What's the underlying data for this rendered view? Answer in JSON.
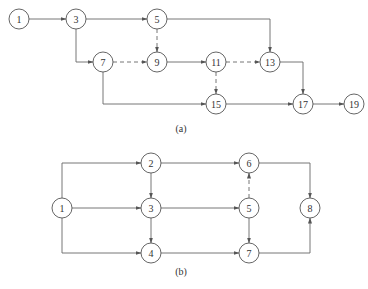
{
  "diagrams": [
    {
      "caption": "(a)",
      "caption_pos": [
        181,
        132
      ],
      "nodes": [
        {
          "id": "1",
          "x": 19,
          "y": 19
        },
        {
          "id": "3",
          "x": 76,
          "y": 19
        },
        {
          "id": "5",
          "x": 157,
          "y": 19
        },
        {
          "id": "7",
          "x": 103,
          "y": 62
        },
        {
          "id": "9",
          "x": 157,
          "y": 62
        },
        {
          "id": "11",
          "x": 216,
          "y": 62
        },
        {
          "id": "13",
          "x": 270,
          "y": 62
        },
        {
          "id": "15",
          "x": 216,
          "y": 104
        },
        {
          "id": "17",
          "x": 303,
          "y": 104
        },
        {
          "id": "19",
          "x": 354,
          "y": 104
        }
      ],
      "edges": [
        {
          "from": "1",
          "to": "3",
          "path": [
            [
              29,
              19
            ],
            [
              66,
              19
            ]
          ],
          "dashed": false
        },
        {
          "from": "3",
          "to": "5",
          "path": [
            [
              86,
              19
            ],
            [
              147,
              19
            ]
          ],
          "dashed": false
        },
        {
          "from": "3",
          "to": "7",
          "path": [
            [
              76,
              29
            ],
            [
              76,
              62
            ],
            [
              93,
              62
            ]
          ],
          "dashed": false
        },
        {
          "from": "5",
          "to": "9",
          "path": [
            [
              157,
              29
            ],
            [
              157,
              52
            ]
          ],
          "dashed": true
        },
        {
          "from": "5",
          "to": "13",
          "path": [
            [
              167,
              19
            ],
            [
              270,
              19
            ],
            [
              270,
              52
            ]
          ],
          "dashed": false
        },
        {
          "from": "7",
          "to": "9",
          "path": [
            [
              113,
              62
            ],
            [
              147,
              62
            ]
          ],
          "dashed": true
        },
        {
          "from": "7",
          "to": "15",
          "path": [
            [
              103,
              72
            ],
            [
              103,
              104
            ],
            [
              206,
              104
            ]
          ],
          "dashed": false
        },
        {
          "from": "9",
          "to": "11",
          "path": [
            [
              167,
              62
            ],
            [
              206,
              62
            ]
          ],
          "dashed": false
        },
        {
          "from": "11",
          "to": "13",
          "path": [
            [
              226,
              62
            ],
            [
              260,
              62
            ]
          ],
          "dashed": true
        },
        {
          "from": "11",
          "to": "15",
          "path": [
            [
              216,
              72
            ],
            [
              216,
              94
            ]
          ],
          "dashed": true
        },
        {
          "from": "13",
          "to": "17",
          "path": [
            [
              280,
              62
            ],
            [
              303,
              62
            ],
            [
              303,
              94
            ]
          ],
          "dashed": false
        },
        {
          "from": "15",
          "to": "17",
          "path": [
            [
              226,
              104
            ],
            [
              293,
              104
            ]
          ],
          "dashed": false
        },
        {
          "from": "17",
          "to": "19",
          "path": [
            [
              313,
              104
            ],
            [
              344,
              104
            ]
          ],
          "dashed": false
        }
      ]
    },
    {
      "caption": "(b)",
      "caption_pos": [
        181,
        275
      ],
      "nodes": [
        {
          "id": "1",
          "x": 62,
          "y": 208
        },
        {
          "id": "2",
          "x": 151,
          "y": 163
        },
        {
          "id": "3",
          "x": 151,
          "y": 208
        },
        {
          "id": "4",
          "x": 151,
          "y": 253
        },
        {
          "id": "6",
          "x": 249,
          "y": 163
        },
        {
          "id": "5",
          "x": 249,
          "y": 208
        },
        {
          "id": "7",
          "x": 249,
          "y": 253
        },
        {
          "id": "8",
          "x": 310,
          "y": 208
        }
      ],
      "edges": [
        {
          "from": "1",
          "to": "2",
          "path": [
            [
              62,
              198
            ],
            [
              62,
              163
            ],
            [
              141,
              163
            ]
          ],
          "dashed": false
        },
        {
          "from": "1",
          "to": "3",
          "path": [
            [
              72,
              208
            ],
            [
              141,
              208
            ]
          ],
          "dashed": false
        },
        {
          "from": "1",
          "to": "4",
          "path": [
            [
              62,
              218
            ],
            [
              62,
              253
            ],
            [
              141,
              253
            ]
          ],
          "dashed": false
        },
        {
          "from": "2",
          "to": "3",
          "path": [
            [
              151,
              173
            ],
            [
              151,
              198
            ]
          ],
          "dashed": false
        },
        {
          "from": "3",
          "to": "4",
          "path": [
            [
              151,
              218
            ],
            [
              151,
              243
            ]
          ],
          "dashed": false
        },
        {
          "from": "2",
          "to": "6",
          "path": [
            [
              161,
              163
            ],
            [
              239,
              163
            ]
          ],
          "dashed": false
        },
        {
          "from": "3",
          "to": "5",
          "path": [
            [
              161,
              208
            ],
            [
              239,
              208
            ]
          ],
          "dashed": false
        },
        {
          "from": "4",
          "to": "7",
          "path": [
            [
              161,
              253
            ],
            [
              239,
              253
            ]
          ],
          "dashed": false
        },
        {
          "from": "5",
          "to": "6",
          "path": [
            [
              249,
              198
            ],
            [
              249,
              173
            ]
          ],
          "dashed": true
        },
        {
          "from": "5",
          "to": "7",
          "path": [
            [
              249,
              218
            ],
            [
              249,
              243
            ]
          ],
          "dashed": false
        },
        {
          "from": "6",
          "to": "8",
          "path": [
            [
              259,
              163
            ],
            [
              310,
              163
            ],
            [
              310,
              198
            ]
          ],
          "dashed": false
        },
        {
          "from": "7",
          "to": "8",
          "path": [
            [
              259,
              253
            ],
            [
              310,
              253
            ],
            [
              310,
              218
            ]
          ],
          "dashed": false
        }
      ]
    }
  ],
  "style": {
    "node_radius": 10,
    "line_color": "#666666"
  }
}
